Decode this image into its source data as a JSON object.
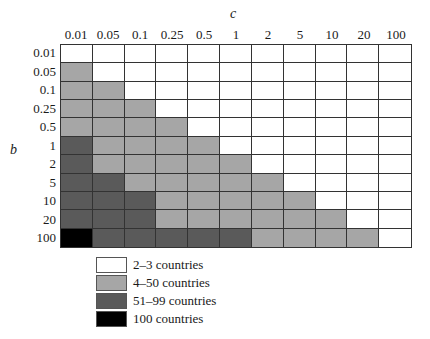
{
  "chart_data": {
    "type": "heatmap",
    "title": "",
    "xlabel": "c",
    "ylabel": "b",
    "x_categories": [
      "0.01",
      "0.05",
      "0.1",
      "0.25",
      "0.5",
      "1",
      "2",
      "5",
      "10",
      "20",
      "100"
    ],
    "y_categories": [
      "0.01",
      "0.05",
      "0.1",
      "0.25",
      "0.5",
      "1",
      "2",
      "5",
      "10",
      "20",
      "100"
    ],
    "legend": [
      {
        "level": 0,
        "label": "2–3 countries",
        "color": "#ffffff"
      },
      {
        "level": 1,
        "label": "4–50 countries",
        "color": "#a6a6a6"
      },
      {
        "level": 2,
        "label": "51–99 countries",
        "color": "#5a5a5a"
      },
      {
        "level": 3,
        "label": "100 countries",
        "color": "#000000"
      }
    ],
    "values": [
      [
        0,
        0,
        0,
        0,
        0,
        0,
        0,
        0,
        0,
        0,
        0
      ],
      [
        1,
        0,
        0,
        0,
        0,
        0,
        0,
        0,
        0,
        0,
        0
      ],
      [
        1,
        1,
        0,
        0,
        0,
        0,
        0,
        0,
        0,
        0,
        0
      ],
      [
        1,
        1,
        1,
        0,
        0,
        0,
        0,
        0,
        0,
        0,
        0
      ],
      [
        1,
        1,
        1,
        1,
        0,
        0,
        0,
        0,
        0,
        0,
        0
      ],
      [
        2,
        1,
        1,
        1,
        1,
        0,
        0,
        0,
        0,
        0,
        0
      ],
      [
        2,
        1,
        1,
        1,
        1,
        1,
        0,
        0,
        0,
        0,
        0
      ],
      [
        2,
        2,
        1,
        1,
        1,
        1,
        1,
        0,
        0,
        0,
        0
      ],
      [
        2,
        2,
        2,
        1,
        1,
        1,
        1,
        1,
        0,
        0,
        0
      ],
      [
        2,
        2,
        2,
        1,
        1,
        1,
        1,
        1,
        1,
        0,
        0
      ],
      [
        3,
        2,
        2,
        2,
        2,
        2,
        1,
        1,
        1,
        1,
        0
      ]
    ],
    "grid": true,
    "legend_position": "bottom-left"
  }
}
